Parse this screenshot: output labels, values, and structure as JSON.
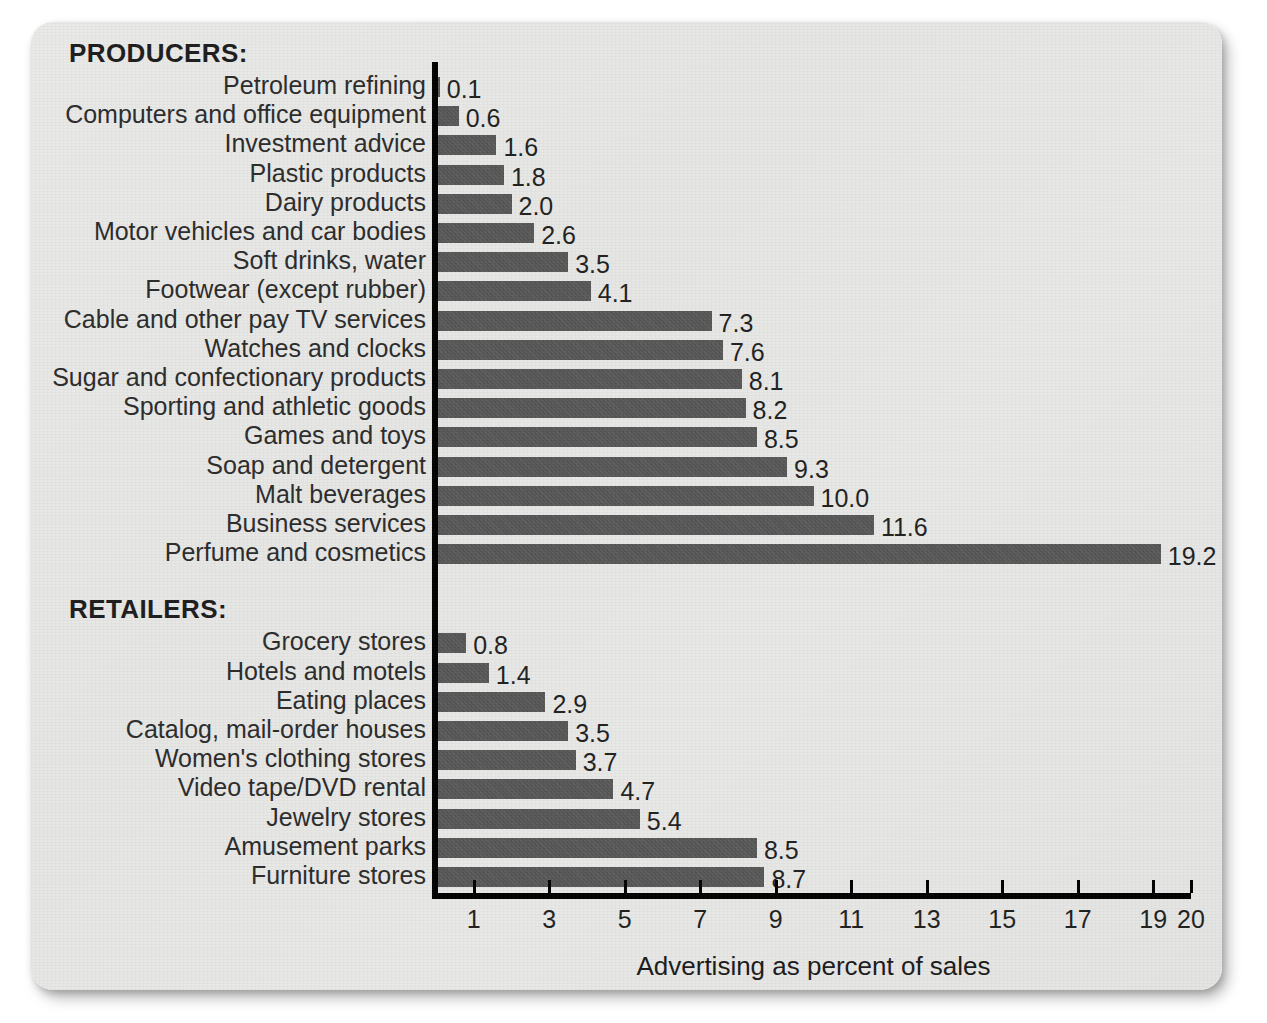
{
  "chart_data": {
    "type": "bar",
    "orientation": "horizontal",
    "title": "",
    "xlabel": "Advertising as percent of sales",
    "ylabel": "",
    "xlim": [
      0,
      20
    ],
    "xticks": [
      "1",
      "3",
      "5",
      "7",
      "9",
      "11",
      "13",
      "15",
      "17",
      "19",
      "20"
    ],
    "xtick_values": [
      1,
      3,
      5,
      7,
      9,
      11,
      13,
      15,
      17,
      19,
      20
    ],
    "grid": false,
    "legend": null,
    "bar_color": "#575757",
    "groups": [
      {
        "name": "PRODUCERS:",
        "categories": [
          "Petroleum refining",
          "Computers and office equipment",
          "Investment advice",
          "Plastic products",
          "Dairy products",
          "Motor vehicles and car bodies",
          "Soft drinks, water",
          "Footwear (except rubber)",
          "Cable and other pay TV services",
          "Watches and clocks",
          "Sugar and confectionary products",
          "Sporting and athletic goods",
          "Games and toys",
          "Soap and detergent",
          "Malt beverages",
          "Business services",
          "Perfume and cosmetics"
        ],
        "values": [
          0.1,
          0.6,
          1.6,
          1.8,
          2.0,
          2.6,
          3.5,
          4.1,
          7.3,
          7.6,
          8.1,
          8.2,
          8.5,
          9.3,
          10.0,
          11.6,
          19.2
        ],
        "labels": [
          "0.1",
          "0.6",
          "1.6",
          "1.8",
          "2.0",
          "2.6",
          "3.5",
          "4.1",
          "7.3",
          "7.6",
          "8.1",
          "8.2",
          "8.5",
          "9.3",
          "10.0",
          "11.6",
          "19.2"
        ]
      },
      {
        "name": "RETAILERS:",
        "categories": [
          "Grocery stores",
          "Hotels and motels",
          "Eating places",
          "Catalog, mail-order houses",
          "Women's clothing stores",
          "Video tape/DVD rental",
          "Jewelry stores",
          "Amusement parks",
          "Furniture stores"
        ],
        "values": [
          0.8,
          1.4,
          2.9,
          3.5,
          3.7,
          4.7,
          5.4,
          8.5,
          8.7
        ],
        "labels": [
          "0.8",
          "1.4",
          "2.9",
          "3.5",
          "3.7",
          "4.7",
          "5.4",
          "8.5",
          "8.7"
        ]
      }
    ]
  }
}
